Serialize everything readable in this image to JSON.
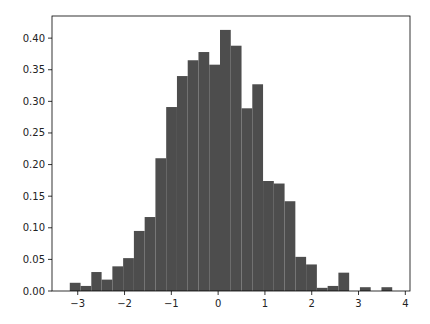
{
  "chart_data": {
    "type": "bar",
    "subtype": "histogram",
    "title": "",
    "xlabel": "",
    "ylabel": "",
    "xlim": [
      -3.55,
      4.1
    ],
    "ylim": [
      0.0,
      0.435
    ],
    "grid": false,
    "legend": null,
    "bar_color": "#4d4d4d",
    "bin_edges": [
      -3.17,
      -2.94,
      -2.71,
      -2.49,
      -2.26,
      -2.03,
      -1.8,
      -1.57,
      -1.34,
      -1.11,
      -0.88,
      -0.65,
      -0.42,
      -0.19,
      0.04,
      0.27,
      0.5,
      0.73,
      0.96,
      1.19,
      1.42,
      1.65,
      1.88,
      2.11,
      2.34,
      2.57,
      2.8,
      3.03,
      3.26,
      3.49,
      3.72
    ],
    "values": [
      0.013,
      0.008,
      0.03,
      0.018,
      0.039,
      0.052,
      0.095,
      0.117,
      0.21,
      0.291,
      0.34,
      0.365,
      0.378,
      0.358,
      0.413,
      0.388,
      0.289,
      0.327,
      0.174,
      0.17,
      0.142,
      0.054,
      0.042,
      0.005,
      0.008,
      0.029,
      0.0,
      0.006,
      0.0,
      0.006
    ],
    "x_ticks": [
      -3,
      -2,
      -1,
      0,
      1,
      2,
      3,
      4
    ],
    "x_tick_labels": [
      "−3",
      "−2",
      "−1",
      "0",
      "1",
      "2",
      "3",
      "4"
    ],
    "y_ticks": [
      0.0,
      0.05,
      0.1,
      0.15,
      0.2,
      0.25,
      0.3,
      0.35,
      0.4
    ],
    "y_tick_labels": [
      "0.00",
      "0.05",
      "0.10",
      "0.15",
      "0.20",
      "0.25",
      "0.30",
      "0.35",
      "0.40"
    ]
  },
  "layout": {
    "plot_left": 52,
    "plot_right": 410,
    "plot_top": 16,
    "plot_bottom": 291
  }
}
